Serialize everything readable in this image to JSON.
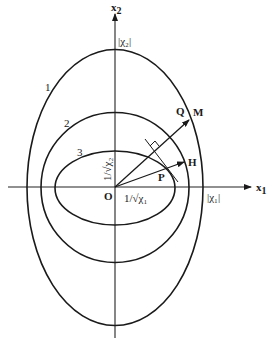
{
  "figure": {
    "type": "ellipse-diagram",
    "colors": {
      "ink": "#1a1a1a",
      "background": "#ffffff"
    },
    "axes": {
      "x": {
        "label": "x",
        "subscript": "1"
      },
      "y": {
        "label": "x",
        "subscript": "2"
      },
      "origin_label": "O"
    },
    "intercept_labels": {
      "x_outer": "|χ₁|",
      "y_outer": "|χ₂|",
      "x_inner": "1/√χ₁",
      "y_inner": "1/√χ₂"
    },
    "curves": [
      {
        "id": "1",
        "label": "1",
        "rx": 88,
        "ry": 138
      },
      {
        "id": "2",
        "label": "2",
        "rx": 74,
        "ry": 75
      },
      {
        "id": "3",
        "label": "3",
        "rx": 60,
        "ry": 37
      }
    ],
    "points": {
      "P": "P",
      "Q": "Q",
      "M": "M",
      "H": "H"
    },
    "vectors": [
      {
        "name": "OM",
        "from": "O",
        "to": "M"
      },
      {
        "name": "OH",
        "from": "O",
        "to": "H"
      }
    ],
    "annotations": {
      "tangent_at_P": true,
      "right_angle_marker": true
    }
  }
}
